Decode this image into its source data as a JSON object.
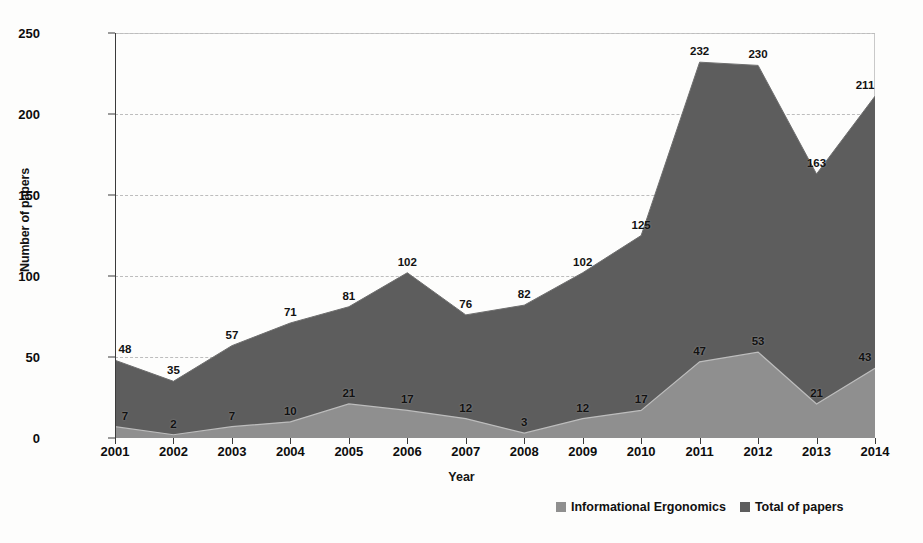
{
  "chart_data": {
    "type": "area",
    "title": "",
    "xlabel": "Year",
    "ylabel": "Number of papers",
    "categories": [
      "2001",
      "2002",
      "2003",
      "2004",
      "2005",
      "2006",
      "2007",
      "2008",
      "2009",
      "2010",
      "2011",
      "2012",
      "2013",
      "2014"
    ],
    "series": [
      {
        "name": "Informational Ergonomics",
        "color": "#8f8f8f",
        "values": [
          7,
          2,
          7,
          10,
          21,
          17,
          12,
          3,
          12,
          17,
          47,
          53,
          21,
          43
        ]
      },
      {
        "name": "Total of papers",
        "color": "#5d5d5d",
        "values": [
          48,
          35,
          57,
          71,
          81,
          102,
          76,
          82,
          102,
          125,
          232,
          230,
          163,
          211
        ]
      }
    ],
    "ylim": [
      0,
      250
    ],
    "yticks": [
      0,
      50,
      100,
      150,
      200,
      250
    ],
    "grid": true,
    "legend_position": "bottom-right"
  },
  "legend": {
    "items": [
      {
        "label": "Informational Ergonomics",
        "color": "#8f8f8f"
      },
      {
        "label": "Total of papers",
        "color": "#5d5d5d"
      }
    ]
  }
}
